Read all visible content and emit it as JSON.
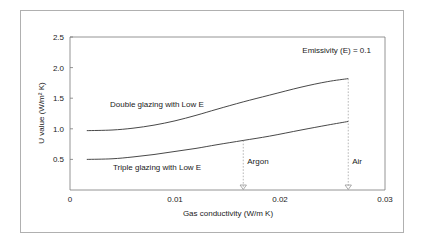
{
  "chart_data": {
    "type": "line",
    "title": "",
    "xlabel": "Gas conductivity (W/m K)",
    "ylabel": "U value (W/m² K)",
    "xlim": [
      0,
      0.03
    ],
    "ylim": [
      0,
      2.5
    ],
    "xticks": [
      "0",
      "0.01",
      "0.02",
      "0.03"
    ],
    "xtick_values": [
      0,
      0.01,
      0.02,
      0.03
    ],
    "yticks": [
      "0.5",
      "1.0",
      "1.5",
      "2.0",
      "2.5"
    ],
    "ytick_values": [
      0.5,
      1.0,
      1.5,
      2.0,
      2.5
    ],
    "grid": false,
    "legend": "inline-labels",
    "series": [
      {
        "name": "Double glazing with Low E",
        "x": [
          0.0016,
          0.004,
          0.006,
          0.008,
          0.01,
          0.012,
          0.014,
          0.0165,
          0.019,
          0.022,
          0.0245,
          0.0265
        ],
        "values": [
          0.97,
          0.98,
          1.01,
          1.06,
          1.13,
          1.22,
          1.32,
          1.44,
          1.55,
          1.68,
          1.77,
          1.82
        ]
      },
      {
        "name": "Triple glazing with Low E",
        "x": [
          0.0016,
          0.004,
          0.006,
          0.008,
          0.01,
          0.012,
          0.014,
          0.0165,
          0.019,
          0.022,
          0.0245,
          0.0265
        ],
        "values": [
          0.5,
          0.51,
          0.54,
          0.58,
          0.63,
          0.68,
          0.74,
          0.81,
          0.88,
          0.98,
          1.06,
          1.12
        ]
      }
    ],
    "annotations": [
      {
        "text": "Emissivity (E) = 0.1",
        "x": 0.0215,
        "y": 2.3
      }
    ],
    "markers": [
      {
        "label": "Argon",
        "x": 0.0165,
        "y_top": 0.81
      },
      {
        "label": "Air",
        "x": 0.0265,
        "y_top": 1.82
      }
    ]
  },
  "colors": {
    "curve": "#333333",
    "axis": "#7a7a7a",
    "marker": "#9a9a9a",
    "frame": "#b0b0b0",
    "text": "#1a1a1a",
    "background": "#ffffff"
  }
}
